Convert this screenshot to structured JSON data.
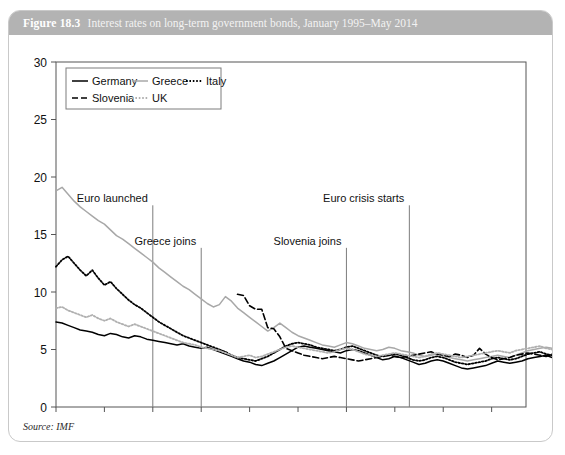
{
  "figure": {
    "number": "Figure 18.3",
    "caption": "Interest rates on long-term government bonds, January 1995–May 2014",
    "source": "Source: IMF"
  },
  "chart_data": {
    "type": "line",
    "title": "Interest rates on long-term government bonds, January 1995–May 2014",
    "xlabel": "",
    "ylabel": "",
    "xlim": [
      "1995M1",
      "2014M5"
    ],
    "ylim": [
      0,
      30
    ],
    "yticks": [
      0,
      5,
      10,
      15,
      20,
      25,
      30
    ],
    "xticks": [
      "1995M1",
      "1997M1",
      "1999M1",
      "2001M1",
      "2003M1",
      "2005M1",
      "2007M1",
      "2009M1",
      "2011M1",
      "2013M1"
    ],
    "grid": false,
    "legend_position": "top-left",
    "series": [
      {
        "name": "Germany",
        "style": "solid",
        "color": "#000000",
        "x_start": 1995.0,
        "x_step": 0.25,
        "values": [
          7.4,
          7.3,
          7.1,
          6.9,
          6.7,
          6.6,
          6.5,
          6.3,
          6.2,
          6.4,
          6.3,
          6.1,
          6.0,
          6.2,
          6.1,
          5.9,
          5.8,
          5.7,
          5.6,
          5.5,
          5.4,
          5.5,
          5.3,
          5.2,
          5.1,
          5.2,
          5.0,
          4.8,
          4.6,
          4.4,
          4.2,
          4.0,
          3.9,
          3.7,
          3.6,
          3.8,
          4.0,
          4.3,
          4.6,
          4.9,
          5.2,
          5.3,
          5.2,
          5.1,
          5.0,
          4.9,
          4.8,
          4.7,
          4.9,
          5.0,
          4.9,
          4.7,
          4.5,
          4.3,
          4.1,
          4.2,
          4.4,
          4.3,
          4.1,
          3.9,
          3.7,
          3.8,
          4.0,
          4.1,
          4.0,
          3.8,
          3.6,
          3.4,
          3.3,
          3.4,
          3.5,
          3.6,
          3.8,
          4.0,
          3.9,
          3.8,
          3.9,
          4.0,
          4.2,
          4.3,
          4.4,
          4.5,
          4.3,
          4.2,
          4.0,
          3.9,
          3.7,
          3.5,
          3.3,
          3.2,
          3.3,
          3.2,
          3.1,
          3.0,
          3.1,
          3.2,
          3.0,
          2.9,
          2.7,
          2.6,
          2.5,
          2.3,
          2.2,
          2.0,
          1.9,
          1.8,
          1.6,
          1.5,
          1.6,
          1.7,
          1.6,
          1.5,
          1.6,
          1.8,
          1.9,
          1.8,
          1.7,
          1.6,
          1.5,
          1.4,
          1.5,
          1.6,
          1.5,
          1.4,
          1.4,
          1.5,
          1.4,
          1.3,
          1.4,
          1.5
        ]
      },
      {
        "name": "Greece",
        "style": "solid",
        "color": "#a8a8a8",
        "x_start": 1995.0,
        "x_step": 0.25,
        "values": [
          18.8,
          19.1,
          18.5,
          17.9,
          17.4,
          17.0,
          16.6,
          16.2,
          15.9,
          15.4,
          14.9,
          14.6,
          14.2,
          13.8,
          13.4,
          13.0,
          12.6,
          12.1,
          11.7,
          11.3,
          10.9,
          10.5,
          10.2,
          9.8,
          9.4,
          9.0,
          8.7,
          8.9,
          9.6,
          9.2,
          8.6,
          8.2,
          7.8,
          7.4,
          7.0,
          6.6,
          6.9,
          7.3,
          6.9,
          6.5,
          6.2,
          6.0,
          5.8,
          5.6,
          5.4,
          5.3,
          5.2,
          5.4,
          5.6,
          5.5,
          5.3,
          5.1,
          5.0,
          4.9,
          5.0,
          5.2,
          5.1,
          4.9,
          4.8,
          4.7,
          4.5,
          4.4,
          4.5,
          4.6,
          4.5,
          4.3,
          4.2,
          4.1,
          4.0,
          4.1,
          4.2,
          4.3,
          4.4,
          4.5,
          4.4,
          4.3,
          4.5,
          4.7,
          4.9,
          5.0,
          5.1,
          5.2,
          5.1,
          5.0,
          5.2,
          5.4,
          5.3,
          5.1,
          5.6,
          6.4,
          5.6,
          5.2,
          4.9,
          5.1,
          5.5,
          6.2,
          6.8,
          7.4,
          9.0,
          10.6,
          11.4,
          12.1,
          12.6,
          13.8,
          16.3,
          15.2,
          17.4,
          19.0,
          21.2,
          23.1,
          28.9,
          22.4,
          27.8,
          21.0,
          18.5,
          16.2,
          14.3,
          12.1,
          10.6,
          9.8,
          10.7,
          9.6,
          9.1,
          8.5,
          9.3,
          8.7,
          8.0,
          7.3,
          6.6,
          6.1
        ]
      },
      {
        "name": "Italy",
        "style": "dotted",
        "color": "#000000",
        "x_start": 1995.0,
        "x_step": 0.25,
        "values": [
          12.2,
          12.8,
          13.1,
          12.5,
          11.9,
          11.4,
          11.9,
          11.2,
          10.6,
          10.9,
          10.3,
          9.8,
          9.3,
          8.9,
          8.6,
          8.2,
          7.8,
          7.4,
          7.1,
          6.8,
          6.5,
          6.2,
          6.0,
          5.8,
          5.6,
          5.4,
          5.2,
          5.0,
          4.8,
          4.5,
          4.3,
          4.2,
          4.1,
          4.0,
          4.2,
          4.4,
          4.7,
          5.0,
          5.3,
          5.5,
          5.6,
          5.5,
          5.4,
          5.2,
          5.1,
          5.0,
          4.9,
          5.0,
          5.2,
          5.3,
          5.1,
          4.9,
          4.7,
          4.5,
          4.4,
          4.5,
          4.6,
          4.5,
          4.3,
          4.1,
          4.0,
          4.1,
          4.3,
          4.4,
          4.3,
          4.1,
          3.9,
          3.8,
          3.7,
          3.8,
          3.9,
          4.0,
          4.2,
          4.3,
          4.2,
          4.1,
          4.2,
          4.4,
          4.6,
          4.7,
          4.8,
          4.6,
          4.5,
          4.4,
          4.6,
          4.5,
          4.3,
          4.5,
          5.1,
          4.6,
          4.3,
          4.1,
          4.2,
          4.3,
          4.5,
          4.6,
          4.7,
          4.6,
          4.5,
          4.4,
          4.6,
          4.9,
          5.4,
          6.9,
          5.9,
          6.4,
          6.8,
          5.6,
          5.2,
          5.0,
          4.8,
          4.5,
          4.7,
          5.1,
          4.9,
          4.6,
          4.4,
          4.2,
          4.3,
          4.4,
          4.2,
          4.0,
          3.9,
          4.0,
          3.9,
          3.8,
          3.6,
          3.4,
          3.2
        ]
      },
      {
        "name": "Slovenia",
        "style": "dashed",
        "color": "#000000",
        "x_start": 2002.5,
        "x_step": 0.25,
        "values": [
          9.8,
          9.7,
          8.8,
          8.5,
          8.5,
          6.9,
          6.8,
          6.1,
          5.1,
          4.9,
          4.7,
          4.5,
          4.4,
          4.3,
          4.2,
          4.3,
          4.4,
          4.3,
          4.2,
          4.1,
          4.0,
          4.1,
          4.2,
          4.3,
          4.4,
          4.5,
          4.4,
          4.3,
          4.4,
          4.5,
          4.6,
          4.7,
          4.8,
          4.6,
          4.5,
          4.4,
          4.6,
          4.5,
          4.3,
          4.5,
          5.1,
          4.6,
          4.3,
          4.1,
          4.2,
          4.3,
          4.5,
          4.6,
          4.7,
          4.6,
          4.5,
          4.4,
          4.6,
          4.9,
          5.4,
          6.9,
          5.9,
          5.6,
          6.2,
          5.4,
          5.1,
          5.3,
          5.0,
          4.7,
          5.3,
          6.6,
          6.1,
          5.5,
          5.8,
          6.4,
          5.9,
          5.4,
          4.6,
          4.1,
          3.7
        ]
      },
      {
        "name": "UK",
        "style": "dotted",
        "color": "#b0b0b0",
        "x_start": 1995.0,
        "x_step": 0.25,
        "values": [
          8.6,
          8.7,
          8.4,
          8.2,
          8.0,
          7.8,
          8.0,
          7.7,
          7.5,
          7.7,
          7.4,
          7.2,
          7.0,
          7.2,
          7.0,
          6.8,
          6.6,
          6.4,
          6.2,
          6.0,
          5.8,
          5.6,
          5.5,
          5.4,
          5.2,
          5.1,
          5.0,
          4.9,
          4.7,
          4.5,
          4.3,
          4.4,
          4.5,
          4.3,
          4.4,
          4.6,
          4.8,
          5.0,
          5.2,
          5.3,
          5.2,
          5.1,
          5.0,
          4.9,
          4.8,
          4.7,
          4.8,
          5.0,
          5.1,
          5.0,
          4.8,
          4.6,
          4.5,
          4.4,
          4.5,
          4.6,
          4.7,
          4.6,
          4.5,
          4.4,
          4.3,
          4.4,
          4.6,
          4.7,
          4.6,
          4.5,
          4.4,
          4.3,
          4.4,
          4.5,
          4.6,
          4.7,
          4.8,
          4.9,
          4.8,
          4.7,
          4.9,
          5.0,
          5.1,
          5.2,
          5.3,
          5.1,
          5.0,
          4.8,
          4.6,
          4.4,
          4.2,
          4.0,
          3.8,
          3.6,
          3.9,
          4.1,
          4.0,
          3.8,
          3.7,
          3.9,
          4.0,
          3.9,
          3.7,
          3.5,
          3.6,
          3.4,
          3.2,
          3.0,
          3.1,
          3.3,
          3.1,
          2.9,
          2.7,
          2.5,
          2.3,
          2.1,
          2.0,
          1.9,
          1.8,
          1.7,
          1.8,
          2.0,
          2.2,
          2.4,
          2.6,
          2.8,
          2.9,
          3.0,
          2.9,
          2.8,
          2.9,
          3.0,
          3.1,
          3.0
        ]
      }
    ],
    "annotations": [
      {
        "text": "Euro launched",
        "x": 1999.0,
        "label_x": 1999.0,
        "label_y": 17.8,
        "align": "end"
      },
      {
        "text": "Greece joins",
        "x": 2001.0,
        "label_x": 2001.0,
        "label_y": 14.1,
        "align": "end"
      },
      {
        "text": "Slovenia joins",
        "x": 2007.0,
        "label_x": 2007.0,
        "label_y": 14.1,
        "align": "end"
      },
      {
        "text": "Euro crisis starts",
        "x": 2009.6,
        "label_x": 2009.6,
        "label_y": 17.8,
        "align": "end"
      }
    ]
  }
}
